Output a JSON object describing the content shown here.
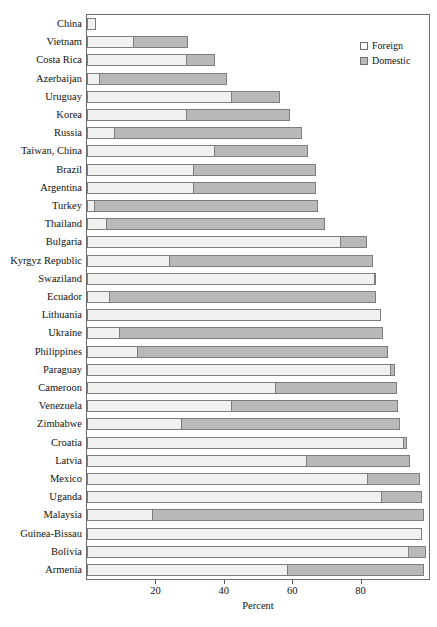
{
  "chart_data": {
    "type": "bar",
    "orientation": "horizontal",
    "stacked": true,
    "title": "",
    "xlabel": "Percent",
    "ylabel": "",
    "xlim": [
      0,
      100
    ],
    "ylim": null,
    "grid": false,
    "legend_position": "top-right",
    "xticks": [
      20,
      40,
      60,
      80
    ],
    "xticklabels": [
      "20",
      "40",
      "60",
      "80"
    ],
    "legend": [
      {
        "name": "Foreign",
        "color": "#f1f1ef"
      },
      {
        "name": "Domestic",
        "color": "#b9b9b9"
      }
    ],
    "categories": [
      "China",
      "Vietnam",
      "Costa Rica",
      "Azerbaijan",
      "Uruguay",
      "Korea",
      "Russia",
      "Taiwan, China",
      "Brazil",
      "Argentina",
      "Turkey",
      "Thailand",
      "Bulgaria",
      "Kyrgyz Republic",
      "Swaziland",
      "Ecuador",
      "Lithuania",
      "Ukraine",
      "Philippines",
      "Paraguay",
      "Cameroon",
      "Venezuela",
      "Zimbabwe",
      "Croatia",
      "Latvia",
      "Mexico",
      "Uganda",
      "Malaysia",
      "Guinea-Bissau",
      "Bolivia",
      "Armenia"
    ],
    "series": [
      {
        "name": "Foreign",
        "color": "#f1f1ef",
        "values": [
          2.5,
          13.5,
          29.0,
          3.5,
          42.0,
          29.0,
          8.0,
          37.0,
          31.0,
          31.0,
          2.0,
          5.5,
          74.0,
          24.0,
          84.0,
          6.5,
          86.0,
          9.5,
          14.5,
          88.5,
          55.0,
          42.0,
          27.5,
          92.5,
          64.0,
          82.0,
          86.0,
          19.0,
          98.0,
          94.0,
          58.5
        ]
      },
      {
        "name": "Domestic",
        "color": "#b9b9b9",
        "values": [
          0.0,
          16.0,
          8.5,
          37.5,
          14.5,
          30.5,
          55.0,
          27.5,
          36.0,
          36.0,
          65.5,
          64.0,
          8.0,
          59.5,
          0.5,
          78.0,
          0.0,
          77.0,
          73.5,
          1.5,
          35.5,
          49.0,
          64.0,
          1.0,
          30.5,
          15.5,
          12.0,
          79.5,
          0.0,
          5.0,
          40.0
        ]
      }
    ],
    "totals": [
      2.5,
      29.5,
      37.5,
      41.0,
      56.5,
      59.5,
      63.0,
      64.5,
      67.0,
      67.0,
      67.5,
      69.5,
      82.0,
      83.5,
      84.5,
      84.5,
      86.0,
      86.5,
      88.0,
      90.0,
      90.5,
      91.0,
      91.5,
      93.5,
      94.5,
      97.5,
      98.0,
      98.5,
      98.0,
      99.0,
      98.5
    ]
  }
}
